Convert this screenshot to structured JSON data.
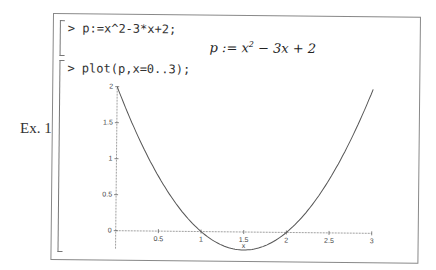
{
  "example_label": "Ex. 1",
  "input1": {
    "prompt": ">",
    "command": "p:=x^2-3*x+2;"
  },
  "output1": {
    "lhs": "p := x",
    "exp": "2",
    "rhs": " − 3x + 2"
  },
  "input2": {
    "prompt": ">",
    "command": "plot(p,x=0..3);"
  },
  "chart_data": {
    "type": "line",
    "title": "",
    "function": "x^2-3*x+2",
    "xlabel": "x",
    "ylabel": "",
    "xlim": [
      0,
      3
    ],
    "ylim": [
      -0.25,
      2
    ],
    "xticks": [
      "0.5",
      "1",
      "1.5",
      "2",
      "2.5",
      "3"
    ],
    "yticks": [
      "0",
      "0.5",
      "1",
      "1.5",
      "2"
    ],
    "x": [
      0,
      0.25,
      0.5,
      0.75,
      1,
      1.25,
      1.5,
      1.75,
      2,
      2.25,
      2.5,
      2.75,
      3
    ],
    "y": [
      2,
      1.3125,
      0.75,
      0.3125,
      0,
      -0.1875,
      -0.25,
      -0.1875,
      0,
      0.3125,
      0.75,
      1.3125,
      2
    ],
    "grid": false,
    "line_color": "#555555"
  }
}
